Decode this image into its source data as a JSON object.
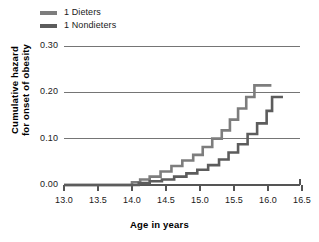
{
  "chart_data": {
    "type": "line",
    "subtype": "step",
    "title": "",
    "xlabel": "Age in years",
    "ylabel": "Cumulative hazard for onset of obesity",
    "ylabel_lines": [
      "Cumulative hazard",
      "for onset of obesity"
    ],
    "xlim": [
      13.0,
      16.5
    ],
    "ylim": [
      0.0,
      0.3
    ],
    "xticks": [
      13.0,
      13.5,
      14.0,
      14.5,
      15.0,
      15.5,
      16.0,
      16.5
    ],
    "xtick_labels": [
      "13.0",
      "13.5",
      "14.0",
      "14.5",
      "15.0",
      "15.5",
      "16.0",
      "16.5"
    ],
    "yticks": [
      0.0,
      0.1,
      0.2,
      0.3
    ],
    "ytick_labels": [
      "0.00",
      "0.10",
      "0.20",
      "0.30"
    ],
    "grid": "horizontal",
    "legend_position": "above-plot-left",
    "series": [
      {
        "name": "1 Dieters",
        "color": "#7d7d7d",
        "points": [
          [
            13.0,
            0.0
          ],
          [
            14.0,
            0.0
          ],
          [
            14.05,
            0.006
          ],
          [
            14.12,
            0.006
          ],
          [
            14.18,
            0.012
          ],
          [
            14.26,
            0.012
          ],
          [
            14.32,
            0.018
          ],
          [
            14.42,
            0.018
          ],
          [
            14.48,
            0.029
          ],
          [
            14.58,
            0.029
          ],
          [
            14.64,
            0.041
          ],
          [
            14.74,
            0.041
          ],
          [
            14.8,
            0.053
          ],
          [
            14.9,
            0.053
          ],
          [
            14.96,
            0.065
          ],
          [
            15.04,
            0.065
          ],
          [
            15.1,
            0.082
          ],
          [
            15.18,
            0.082
          ],
          [
            15.24,
            0.1
          ],
          [
            15.32,
            0.1
          ],
          [
            15.38,
            0.118
          ],
          [
            15.44,
            0.118
          ],
          [
            15.5,
            0.141
          ],
          [
            15.56,
            0.141
          ],
          [
            15.62,
            0.165
          ],
          [
            15.68,
            0.165
          ],
          [
            15.74,
            0.19
          ],
          [
            15.8,
            0.19
          ],
          [
            15.86,
            0.215
          ],
          [
            16.05,
            0.215
          ]
        ]
      },
      {
        "name": "1 Nondieters",
        "color": "#5c5c5c",
        "points": [
          [
            13.0,
            0.0
          ],
          [
            14.1,
            0.0
          ],
          [
            14.16,
            0.004
          ],
          [
            14.26,
            0.004
          ],
          [
            14.32,
            0.008
          ],
          [
            14.44,
            0.008
          ],
          [
            14.5,
            0.012
          ],
          [
            14.62,
            0.012
          ],
          [
            14.68,
            0.018
          ],
          [
            14.8,
            0.018
          ],
          [
            14.86,
            0.025
          ],
          [
            14.96,
            0.025
          ],
          [
            15.02,
            0.033
          ],
          [
            15.12,
            0.033
          ],
          [
            15.18,
            0.043
          ],
          [
            15.28,
            0.043
          ],
          [
            15.34,
            0.055
          ],
          [
            15.42,
            0.055
          ],
          [
            15.48,
            0.07
          ],
          [
            15.56,
            0.07
          ],
          [
            15.62,
            0.088
          ],
          [
            15.7,
            0.088
          ],
          [
            15.76,
            0.11
          ],
          [
            15.84,
            0.11
          ],
          [
            15.9,
            0.133
          ],
          [
            15.98,
            0.133
          ],
          [
            16.02,
            0.16
          ],
          [
            16.06,
            0.16
          ],
          [
            16.1,
            0.19
          ],
          [
            16.22,
            0.19
          ]
        ]
      }
    ],
    "axis_color": "#555555",
    "grid_color": "#666666",
    "text_color": "#1a1a1a",
    "background": "#ffffff"
  },
  "legend": {
    "items": [
      {
        "label": "1 Dieters",
        "swatch_color": "#7d7d7d"
      },
      {
        "label": "1 Nondieters",
        "swatch_color": "#5c5c5c"
      }
    ]
  },
  "axes": {
    "x_axis_title": "Age in years",
    "y_axis_title_line1": "Cumulative hazard",
    "y_axis_title_line2": "for onset of obesity"
  }
}
